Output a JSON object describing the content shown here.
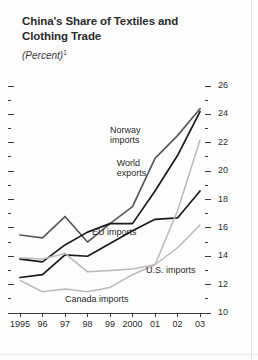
{
  "figure": {
    "title_lines": [
      "China's Share of Textiles and",
      "Clothing Trade"
    ],
    "subtitle": "(Percent)",
    "subtitle_footnote_marker": "1"
  },
  "colors": {
    "dark_line": "#1a1a1a",
    "mid_line": "#5a5a5a",
    "light_line": "#b9b9b9",
    "axis": "#3a3a3a",
    "text": "#2b2b2b",
    "background": "#fdfdfd"
  },
  "chart_data": {
    "type": "line",
    "title": "China's Share of Textiles and Clothing Trade",
    "subtitle": "(Percent)",
    "xlabel": "",
    "ylabel": "",
    "x": [
      1995,
      1996,
      1997,
      1998,
      1999,
      2000,
      2001,
      2002,
      2003
    ],
    "xtick_labels": [
      "1995",
      "96",
      "97",
      "98",
      "99",
      "2000",
      "01",
      "02",
      "03"
    ],
    "ylim": [
      10,
      26
    ],
    "ytick_labels": [
      "10",
      "12",
      "14",
      "16",
      "18",
      "20",
      "22",
      "24",
      "26"
    ],
    "ytick_values": [
      10,
      12,
      14,
      16,
      18,
      20,
      22,
      24,
      26
    ],
    "yminor_step": 1,
    "grid": false,
    "legend": "inline-annotations",
    "series": [
      {
        "name": "Norway imports",
        "color": "#5a5a5a",
        "label_x": 1999.0,
        "label_y": 22.9,
        "values": [
          15.5,
          15.3,
          16.8,
          15.0,
          16.3,
          17.5,
          20.9,
          22.5,
          24.4
        ]
      },
      {
        "name": "World exports",
        "color": "#1a1a1a",
        "label_x": 1999.3,
        "label_y": 20.6,
        "values": [
          13.8,
          13.6,
          14.8,
          15.7,
          16.3,
          16.3,
          18.6,
          21.1,
          24.2
        ]
      },
      {
        "name": "EU imports",
        "color": "#1a1a1a",
        "label_x": 1998.2,
        "label_y": 15.7,
        "values": [
          12.5,
          12.7,
          14.1,
          14.0,
          14.9,
          15.8,
          16.6,
          16.7,
          18.6
        ]
      },
      {
        "name": "U.S. imports",
        "color": "#b9b9b9",
        "label_x": 2000.6,
        "label_y": 13.0,
        "values": [
          13.9,
          13.8,
          14.2,
          12.9,
          13.0,
          13.1,
          13.4,
          17.2,
          22.2
        ]
      },
      {
        "name": "Canada imports",
        "color": "#b9b9b9",
        "label_x": 1997.0,
        "label_y": 11.0,
        "values": [
          12.3,
          11.5,
          11.7,
          11.5,
          11.8,
          12.7,
          13.4,
          14.6,
          16.2
        ]
      }
    ]
  }
}
